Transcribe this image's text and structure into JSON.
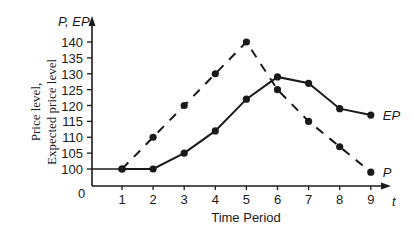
{
  "chart_data": {
    "type": "line",
    "title": "",
    "xlabel": "Time Period",
    "ylabel_line1": "Price level,",
    "ylabel_line2": "Expected price level",
    "y_axis_symbol": "P, EP",
    "x_axis_symbol": "t",
    "origin_label": "0",
    "x": [
      1,
      2,
      3,
      4,
      5,
      6,
      7,
      8,
      9
    ],
    "x_ticks": [
      "1",
      "2",
      "3",
      "4",
      "5",
      "6",
      "7",
      "8",
      "9"
    ],
    "y_ticks": [
      "100",
      "105",
      "110",
      "115",
      "120",
      "125",
      "130",
      "135",
      "140"
    ],
    "y_tick_values": [
      100,
      105,
      110,
      115,
      120,
      125,
      130,
      135,
      140
    ],
    "ylim": [
      95,
      145
    ],
    "grid": false,
    "legend": "inline labels at series end",
    "series": [
      {
        "name": "P",
        "label": "P",
        "style": "dashed",
        "values": [
          100,
          110,
          120,
          130,
          140,
          125,
          115,
          107,
          99
        ]
      },
      {
        "name": "EP",
        "label": "EP",
        "style": "solid",
        "values": [
          100,
          100,
          105,
          112,
          122,
          129,
          127,
          119,
          117
        ]
      }
    ],
    "baseline": {
      "value": 100,
      "from_x": 0,
      "to_x": 2,
      "style": "solid"
    }
  },
  "colors": {
    "ink": "#1a1a1a",
    "background": "#ffffff"
  }
}
